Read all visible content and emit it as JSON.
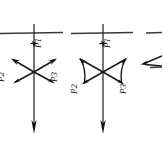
{
  "figure": {
    "type": "force-vector-diagram",
    "background_color": "#ffffff",
    "ink_color": "#1a1a1a",
    "panel_count": 3
  },
  "labels": {
    "p1": "P1",
    "p2": "P2",
    "p3": "P3"
  },
  "panels": [
    {
      "id": "panel-1",
      "name": "straight-vector-panel",
      "axis_x": 34,
      "horizontal_y": 33,
      "p1_label": "P1",
      "p2_label": "P2",
      "p3_label": "P3",
      "arrow_style": "straight"
    },
    {
      "id": "panel-2",
      "name": "curved-vector-panel",
      "axis_x": 103,
      "horizontal_y": 33,
      "p1_label": "P1",
      "p2_label": "P2",
      "p3_label": "P3",
      "arrow_style": "curved"
    },
    {
      "id": "panel-3",
      "name": "clipped-panel",
      "axis_x": 168,
      "horizontal_y": 33,
      "arrow_style": "clipped"
    }
  ]
}
